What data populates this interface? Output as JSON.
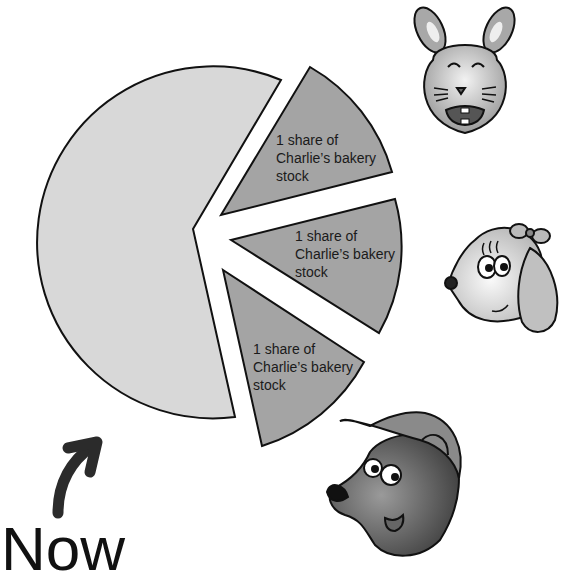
{
  "diagram": {
    "caption": "Now",
    "colors": {
      "whole_slice": "#d8d8d8",
      "share_slice": "#a4a4a4",
      "outline": "#111111",
      "arrow": "#2b2b2b"
    },
    "slices": [
      {
        "label_line1": "1 share of",
        "label_line2": "Charlie’s bakery",
        "label_line3": "stock"
      },
      {
        "label_line1": "1 share of",
        "label_line2": "Charlie’s bakery",
        "label_line3": "stock"
      },
      {
        "label_line1": "1 share of",
        "label_line2": "Charlie’s bakery",
        "label_line3": "stock"
      }
    ],
    "characters": [
      "rabbit",
      "dog",
      "bear"
    ]
  }
}
